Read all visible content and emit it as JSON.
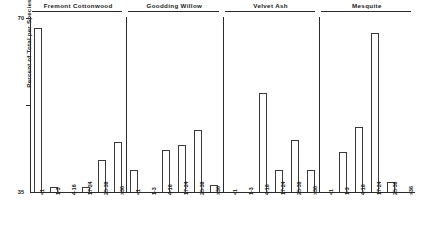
{
  "chart_data": {
    "type": "bar",
    "title": "",
    "subtitle": "",
    "xlabel": "",
    "ylabel": "Percent of Total per Species",
    "ylim": [
      0,
      70
    ],
    "yticks": [
      35,
      70
    ],
    "ytick_labels": [
      "35",
      "70"
    ],
    "grid": false,
    "legend": null,
    "categories": [
      "<1",
      "1-3",
      "4-16",
      "17-24",
      "25-36",
      ">36"
    ],
    "panels": [
      {
        "name": "Fremont Cottonwood",
        "categories": [
          "<1",
          "1-3",
          "4-16",
          "17-24",
          "25-36",
          ">36"
        ],
        "values": [
          66,
          2,
          0,
          2,
          13,
          20
        ]
      },
      {
        "name": "Goodding Willow",
        "categories": [
          "<1",
          "1-3",
          "4-16",
          "17-24",
          "25-36",
          ">36"
        ],
        "values": [
          9,
          0,
          17,
          19,
          25,
          3
        ]
      },
      {
        "name": "Velvet Ash",
        "categories": [
          "<1",
          "1-3",
          "4-16",
          "17-24",
          "25-36",
          ">36"
        ],
        "values": [
          0,
          0,
          40,
          9,
          21,
          9
        ]
      },
      {
        "name": "Mesquite",
        "categories": [
          "<1",
          "1-3",
          "4-16",
          "17-24",
          "25-36",
          ">36"
        ],
        "values": [
          0,
          16,
          26,
          64,
          4,
          0
        ]
      }
    ]
  },
  "axis": {
    "y_title": "Percent of Total per Species",
    "y_tick_top": "70",
    "y_tick_mid": "35"
  },
  "panels": [
    {
      "title": "Fremont Cottonwood"
    },
    {
      "title": "Goodding Willow"
    },
    {
      "title": "Velvet Ash"
    },
    {
      "title": "Mesquite"
    }
  ],
  "colors": {
    "ink": "#2b2b2b",
    "bar_stroke": "#3a3a3a",
    "bar_fill": "#ffffff",
    "background": "#ffffff"
  }
}
